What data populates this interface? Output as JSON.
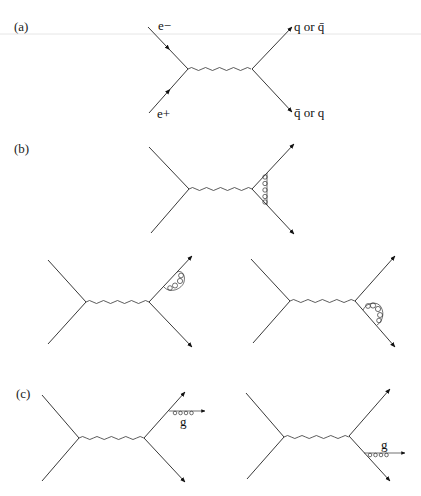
{
  "figure": {
    "panels": [
      {
        "id": "a",
        "label": "(a)",
        "diagrams": [
          {
            "name": "lowest-order",
            "labels": {
              "incoming_top": "e−",
              "incoming_bottom": "e+",
              "outgoing_top": "q or q̄",
              "outgoing_bottom": "q̄ or q"
            }
          }
        ]
      },
      {
        "id": "b",
        "label": "(b)",
        "diagrams": [
          {
            "name": "vertex-correction"
          },
          {
            "name": "self-energy-quark"
          },
          {
            "name": "self-energy-antiquark"
          }
        ]
      },
      {
        "id": "c",
        "label": "(c)",
        "diagrams": [
          {
            "name": "gluon-emission-quark",
            "labels": {
              "gluon": "g"
            }
          },
          {
            "name": "gluon-emission-antiquark",
            "labels": {
              "gluon": "g"
            }
          }
        ]
      }
    ],
    "colors": {
      "line": "#222222",
      "background": "#ffffff"
    }
  }
}
